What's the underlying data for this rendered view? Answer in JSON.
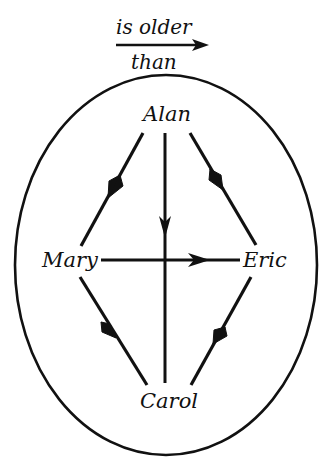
{
  "legend": {
    "relation_top": "is older",
    "relation_bottom": "than",
    "arrow_icon": "right-arrow-icon"
  },
  "nodes": {
    "alan": {
      "label": "Alan",
      "x": 166,
      "y": 117
    },
    "mary": {
      "label": "Mary",
      "x": 68,
      "y": 260
    },
    "eric": {
      "label": "Eric",
      "x": 263,
      "y": 260
    },
    "carol": {
      "label": "Carol",
      "x": 166,
      "y": 403
    }
  },
  "edges": [
    {
      "from": "Alan",
      "to": "Mary",
      "meaning": "Alan is older than Mary"
    },
    {
      "from": "Alan",
      "to": "Carol",
      "meaning": "Alan is older than Carol"
    },
    {
      "from": "Alan",
      "to": "Eric",
      "meaning": "Alan is older than Eric"
    },
    {
      "from": "Mary",
      "to": "Eric",
      "meaning": "Mary is older than Eric"
    },
    {
      "from": "Mary",
      "to": "Carol",
      "meaning": "Mary is older than Carol"
    },
    {
      "from": "Carol",
      "to": "Eric",
      "meaning": "Carol is older than Eric"
    }
  ],
  "colors": {
    "ink": "#111111",
    "background": "#ffffff"
  },
  "boundary": {
    "shape": "ellipse",
    "cx": 166,
    "cy": 265,
    "rx": 151,
    "ry": 190
  }
}
